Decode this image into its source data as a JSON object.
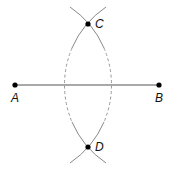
{
  "diagram": {
    "points": {
      "A": {
        "label": "A",
        "x": 15,
        "y": 85
      },
      "B": {
        "label": "B",
        "x": 159,
        "y": 85
      },
      "C": {
        "label": "C",
        "x": 88,
        "y": 24
      },
      "D": {
        "label": "D",
        "x": 88,
        "y": 147
      }
    },
    "colors": {
      "segment": "#555555",
      "arc": "#888888",
      "point": "#000000",
      "label": "#111111"
    }
  }
}
